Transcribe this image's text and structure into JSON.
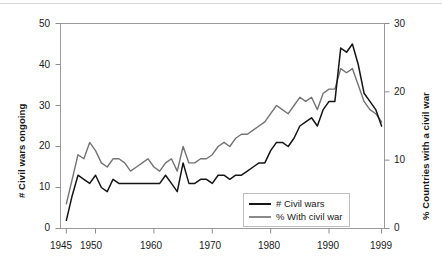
{
  "chart_data": {
    "type": "line",
    "title": "",
    "xlabel": "",
    "ylabel": "# Civil wars ongoing",
    "y2label": "% Countries with a civil war",
    "grid": false,
    "legend_position": "bottom-right",
    "xlim": [
      1944,
      1999.5
    ],
    "ylim": [
      0,
      50
    ],
    "y2lim": [
      0,
      30
    ],
    "xticks": [
      1945,
      1950,
      1960,
      1970,
      1980,
      1990,
      1999
    ],
    "xtick_labels": [
      "1945",
      "1950",
      "1960",
      "1970",
      "1980",
      "1990",
      "1999"
    ],
    "yticks": [
      0,
      10,
      20,
      30,
      40,
      50
    ],
    "ytick_labels": [
      "0",
      "10",
      "20",
      "30",
      "40",
      "50"
    ],
    "y2ticks": [
      0,
      10,
      20,
      30
    ],
    "y2tick_labels": [
      "0",
      "10",
      "20",
      "30"
    ],
    "x": [
      1945,
      1946,
      1947,
      1948,
      1949,
      1950,
      1951,
      1952,
      1953,
      1954,
      1955,
      1956,
      1957,
      1958,
      1959,
      1960,
      1961,
      1962,
      1963,
      1964,
      1965,
      1966,
      1967,
      1968,
      1969,
      1970,
      1971,
      1972,
      1973,
      1974,
      1975,
      1976,
      1977,
      1978,
      1979,
      1980,
      1981,
      1982,
      1983,
      1984,
      1985,
      1986,
      1987,
      1988,
      1989,
      1990,
      1991,
      1992,
      1993,
      1994,
      1995,
      1996,
      1997,
      1998,
      1999
    ],
    "series": [
      {
        "name": "# Civil wars",
        "axis": "left",
        "color": "#151515",
        "values": [
          2,
          8,
          13,
          12,
          11,
          13,
          10,
          9,
          12,
          11,
          11,
          11,
          11,
          11,
          11,
          11,
          11,
          13,
          11,
          9,
          16,
          11,
          11,
          12,
          12,
          11,
          13,
          13,
          12,
          13,
          13,
          14,
          15,
          16,
          16,
          19,
          21,
          21,
          20,
          22,
          25,
          26,
          27,
          25,
          29,
          31,
          31,
          44,
          43,
          45,
          40,
          33,
          31,
          29,
          25
        ]
      },
      {
        "name": "% With civil war",
        "axis": "right",
        "color": "#8a8a8a",
        "values": [
          3.6,
          7.2,
          10.8,
          10.2,
          12.6,
          11.4,
          9.6,
          9.0,
          10.2,
          10.2,
          9.6,
          8.4,
          9.0,
          9.6,
          10.2,
          9.0,
          8.4,
          9.6,
          10.2,
          8.4,
          12.0,
          9.6,
          9.6,
          10.2,
          10.2,
          10.8,
          12.0,
          12.6,
          12.0,
          13.2,
          13.8,
          13.8,
          14.4,
          15.0,
          15.6,
          16.8,
          18.0,
          17.4,
          16.8,
          18.0,
          19.2,
          18.6,
          19.2,
          17.4,
          19.8,
          20.4,
          20.4,
          23.4,
          22.8,
          23.4,
          21.0,
          18.6,
          17.4,
          16.8,
          15.6
        ]
      }
    ]
  },
  "legend": {
    "items": [
      {
        "label": "# Civil wars"
      },
      {
        "label": "% With civil war"
      }
    ]
  }
}
